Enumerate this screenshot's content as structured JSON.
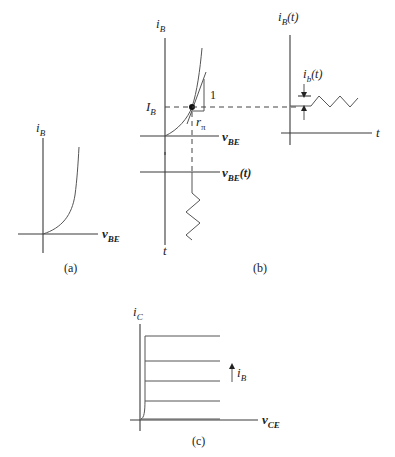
{
  "figure": {
    "panel_a": {
      "caption": "(a)",
      "y_label": {
        "main": "i",
        "sub": "B"
      },
      "x_label": {
        "main": "v",
        "sub": "BE"
      },
      "description": "Exponential input characteristic i_B vs v_BE"
    },
    "panel_b": {
      "caption": "(b)",
      "y_label": {
        "main": "i",
        "sub": "B"
      },
      "x_label": {
        "main": "v",
        "sub": "BE"
      },
      "operating_point_label": {
        "main": "I",
        "sub": "B"
      },
      "slope_rise_label": "1",
      "slope_run_label": {
        "main": "r",
        "sub": "π"
      },
      "lower_axis_label": {
        "main": "v",
        "sub": "BE",
        "suffix": "(t)"
      },
      "lower_time_label": "t",
      "right_y_label": {
        "main": "i",
        "sub": "B",
        "suffix": "(t)"
      },
      "right_x_label": "t",
      "signal_label": {
        "main": "i",
        "sub": "b",
        "suffix": "(t)"
      }
    },
    "panel_c": {
      "caption": "(c)",
      "y_label": {
        "main": "i",
        "sub": "C"
      },
      "x_label": {
        "main": "v",
        "sub": "CE"
      },
      "arrow_label": {
        "main": "i",
        "sub": "B"
      },
      "curve_count": 4
    }
  }
}
